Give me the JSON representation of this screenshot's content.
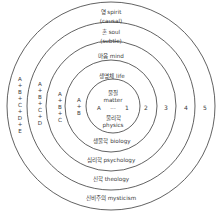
{
  "diagram": {
    "type": "concentric-circles",
    "colors": {
      "stroke": "#3a3a3a",
      "text": "#3a3a3a",
      "background": "#ffffff"
    },
    "center": {
      "matter_label": "물질",
      "matter_en": "matter",
      "physics_label": "물리학",
      "physics_en": "physics",
      "letter": "A",
      "dots": "...",
      "number": "1"
    },
    "rings": [
      {
        "number": "2",
        "top": "생명체 life",
        "top2": "",
        "bottom": "생물학 biology",
        "formula": [
          "A",
          "+",
          "B"
        ]
      },
      {
        "number": "3",
        "top": "마음 mind",
        "top2": "",
        "bottom": "심리학 psychology",
        "formula": [
          "A",
          "+",
          "B",
          "+",
          "C"
        ]
      },
      {
        "number": "4",
        "top": "혼 soul",
        "top2": "(subtle)",
        "bottom": "신학 theology",
        "formula": [
          "A",
          "+",
          "B",
          "+",
          "C",
          "+",
          "D"
        ]
      },
      {
        "number": "5",
        "top": "영 spirit",
        "top2": "(causal)",
        "bottom": "신비주의 mysticism",
        "formula": [
          "A",
          "+",
          "B",
          "+",
          "C",
          "+",
          "D",
          "+",
          "E"
        ]
      }
    ]
  }
}
